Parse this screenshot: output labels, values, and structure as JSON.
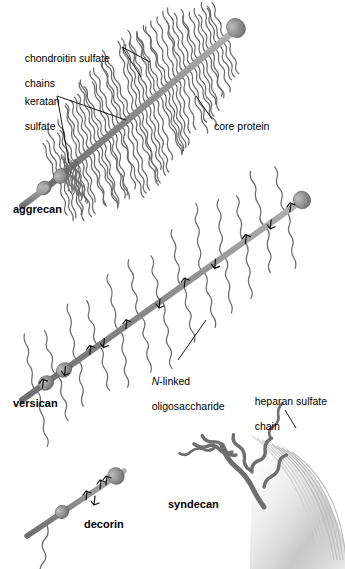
{
  "figure": {
    "background_color": "#ffffff",
    "ink_color": "#000000",
    "protein_color": "#8c8c8c",
    "chain_color": "#6b6b6b",
    "membrane_color": "#bdbdbd"
  },
  "labels": {
    "chondroitin_sulfate_line1": "chondroitin sulfate",
    "chondroitin_sulfate_line2": "chains",
    "keratan_sulfate_line1": "keratan",
    "keratan_sulfate_line2": "sulfate",
    "core_protein": "core protein",
    "n_linked_italic": "N",
    "n_linked_rest": "-linked",
    "oligosaccharide": "oligosaccharide",
    "heparan_sulfate_line1": "heparan sulfate",
    "heparan_sulfate_line2": "chain"
  },
  "molecules": [
    {
      "id": "aggrecan",
      "name": "aggrecan"
    },
    {
      "id": "versican",
      "name": "versican"
    },
    {
      "id": "decorin",
      "name": "decorin"
    },
    {
      "id": "syndecan",
      "name": "syndecan"
    }
  ]
}
